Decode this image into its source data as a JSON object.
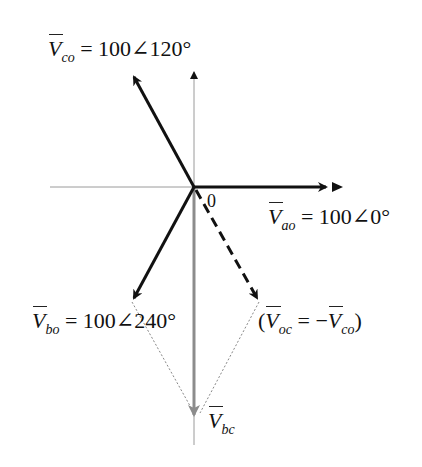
{
  "diagram": {
    "origin_label": "0",
    "phasors": [
      {
        "id": "Vao",
        "symbol": "V",
        "subscript": "ao",
        "label": "= 100∠0°",
        "magnitude": 100,
        "angle_deg": 0,
        "style": "solid-black"
      },
      {
        "id": "Vco",
        "symbol": "V",
        "subscript": "co",
        "label": "= 100∠120°",
        "magnitude": 100,
        "angle_deg": 120,
        "style": "solid-black"
      },
      {
        "id": "Vbo",
        "symbol": "V",
        "subscript": "bo",
        "label": "= 100∠240°",
        "magnitude": 100,
        "angle_deg": 240,
        "style": "solid-black"
      },
      {
        "id": "Voc",
        "symbol": "V",
        "subscript": "oc",
        "label_prefix": "(",
        "label": "= −",
        "label_symbol2": "V",
        "label_sub2": "co",
        "label_suffix": ")",
        "angle_deg": 300,
        "style": "dashed-black"
      },
      {
        "id": "Vbc",
        "symbol": "V",
        "subscript": "bc",
        "angle_deg": 270,
        "style": "solid-gray"
      }
    ],
    "colors": {
      "phasor": "#111111",
      "axis": "#9a9a9a",
      "result": "#8c8c8c",
      "construction": "#888888"
    }
  }
}
